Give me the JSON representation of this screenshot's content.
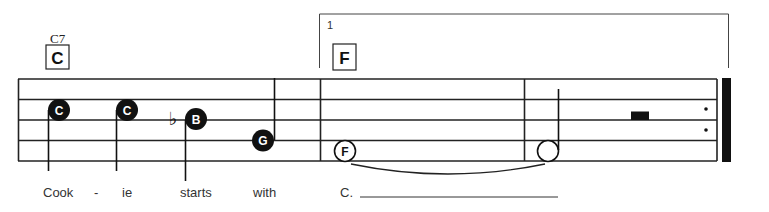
{
  "score": {
    "chords": [
      {
        "name": "C7",
        "box_label": "C"
      },
      {
        "name": "",
        "box_label": "F"
      }
    ],
    "ending": {
      "number": "1"
    },
    "notes": [
      {
        "letter": "C",
        "filled": true
      },
      {
        "letter": "C",
        "filled": true
      },
      {
        "letter": "B",
        "filled": true,
        "accidental": "♭"
      },
      {
        "letter": "G",
        "filled": true
      },
      {
        "letter": "F",
        "filled": false
      },
      {
        "letter": "",
        "filled": false
      }
    ],
    "lyrics": [
      "Cook",
      "-",
      "ie",
      "starts",
      "with",
      "C."
    ],
    "colors": {
      "ink": "#111111",
      "background": "#ffffff"
    }
  }
}
